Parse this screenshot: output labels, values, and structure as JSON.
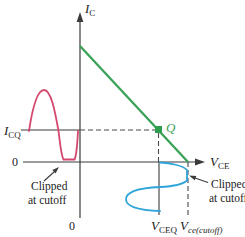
{
  "figure": {
    "background": "#ffffff",
    "colors": {
      "load_line": "#3aa257",
      "q_point": "#2e9e4f",
      "q_label": "#3aa257",
      "input_wave": "#d4486e",
      "output_wave": "#2fa4da",
      "axis": "#3b3b3b",
      "dash": "#4a4a4a",
      "text": "#1c1c1c"
    },
    "labels": {
      "y_axis_base": "I",
      "y_axis_sub": "C",
      "x_axis_base": "V",
      "x_axis_sub": "CE",
      "icq_base": "I",
      "icq_sub": "CQ",
      "zero_left": "0",
      "zero_bottom": "0",
      "q": "Q",
      "vceq_base": "V",
      "vceq_sub": "CEQ",
      "vce_cutoff_base": "V",
      "vce_cutoff_sub": "ce(cutoff)",
      "clip_left": {
        "line1": "Clipped",
        "line2": "at cutoff"
      },
      "clip_right": {
        "line1": "Clipped",
        "line2": "at cutoff"
      }
    }
  }
}
